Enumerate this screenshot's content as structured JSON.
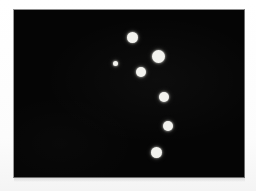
{
  "image": {
    "kind": "dot-field-plate",
    "width": 256,
    "height": 191,
    "background_color": "#ffffff",
    "alt_text": ""
  },
  "plate": {
    "label": "",
    "x": 13,
    "y": 9,
    "width": 232,
    "height": 169,
    "fill_color": "#050505",
    "border_color": "#8e8e8e"
  },
  "chart_data": {
    "type": "scatter",
    "title": "",
    "subtitle": "",
    "xlabel": "",
    "ylabel": "",
    "grid": false,
    "legend": null,
    "background_color": "#050505",
    "point_color": "#f2f2ee",
    "xlim": [
      0,
      232
    ],
    "ylim": [
      0,
      169
    ],
    "units": "pixels",
    "point_count": 7,
    "size_encoding": "diameter_px",
    "points": [
      {
        "id": "dot-1",
        "x": 118,
        "y": 27,
        "d": 11
      },
      {
        "id": "dot-2",
        "x": 144,
        "y": 46,
        "d": 13
      },
      {
        "id": "dot-3",
        "x": 101,
        "y": 53,
        "d": 5
      },
      {
        "id": "dot-4",
        "x": 127,
        "y": 62,
        "d": 10
      },
      {
        "id": "dot-5",
        "x": 150,
        "y": 87,
        "d": 10
      },
      {
        "id": "dot-6",
        "x": 154,
        "y": 116,
        "d": 10
      },
      {
        "id": "dot-7",
        "x": 142,
        "y": 142,
        "d": 11
      }
    ]
  }
}
